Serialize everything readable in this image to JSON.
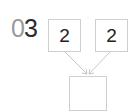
{
  "problem": {
    "number_prefix": "0",
    "number_digit": "3"
  },
  "inputs": {
    "left_value": "2",
    "right_value": "2"
  },
  "result": {
    "value": ""
  },
  "colors": {
    "box_border": "#cfcfcf",
    "arrow": "#c8c8c8",
    "number_light": "#9a9a9a",
    "number_dark": "#2b2b2b",
    "text": "#222222"
  }
}
